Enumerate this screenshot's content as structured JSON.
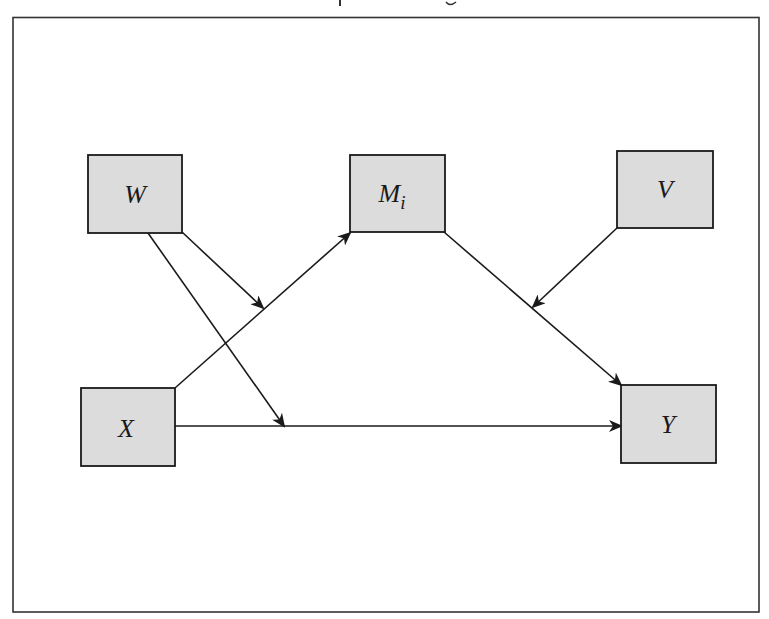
{
  "diagram": {
    "type": "path-model",
    "colors": {
      "box_fill": "#dcdcdc",
      "stroke": "#1a1a1a",
      "background": "#ffffff"
    },
    "frame": {
      "x": 13,
      "y": 17,
      "width": 746,
      "height": 595
    },
    "nodes": [
      {
        "id": "W",
        "label": "W",
        "sub": "",
        "x": 88,
        "y": 155,
        "width": 94,
        "height": 78
      },
      {
        "id": "M",
        "label": "M",
        "sub": "i",
        "x": 350,
        "y": 155,
        "width": 95,
        "height": 77
      },
      {
        "id": "V",
        "label": "V",
        "sub": "",
        "x": 617,
        "y": 151,
        "width": 96,
        "height": 77
      },
      {
        "id": "X",
        "label": "X",
        "sub": "",
        "x": 81,
        "y": 388,
        "width": 94,
        "height": 78
      },
      {
        "id": "Y",
        "label": "Y",
        "sub": "",
        "x": 621,
        "y": 385,
        "width": 95,
        "height": 78
      }
    ],
    "edges": [
      {
        "from": "X",
        "to": "M",
        "description": "X to M_i"
      },
      {
        "from": "M",
        "to": "Y",
        "description": "M_i to Y"
      },
      {
        "from": "X",
        "to": "Y",
        "description": "X to Y (direct effect)"
      },
      {
        "from": "W",
        "to": "X->M path",
        "description": "W moderates X to M_i"
      },
      {
        "from": "W",
        "to": "X->Y path",
        "description": "W moderates X to Y"
      },
      {
        "from": "V",
        "to": "M->Y path",
        "description": "V moderates M_i to Y"
      }
    ]
  }
}
